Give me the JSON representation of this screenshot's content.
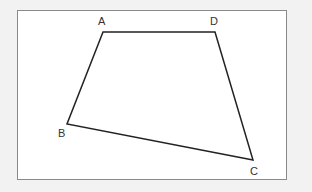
{
  "diagram": {
    "type": "quadrilateral",
    "vertices": [
      {
        "label": "A",
        "x": 103,
        "y": 32,
        "label_x": 98,
        "label_y": 25
      },
      {
        "label": "D",
        "x": 215,
        "y": 32,
        "label_x": 210,
        "label_y": 25
      },
      {
        "label": "C",
        "x": 253,
        "y": 160,
        "label_x": 250,
        "label_y": 175
      },
      {
        "label": "B",
        "x": 67,
        "y": 124,
        "label_x": 58,
        "label_y": 137
      }
    ],
    "edges": [
      "AD",
      "DC",
      "CB",
      "BA"
    ],
    "colors": {
      "frame": "#8a8a8a",
      "line": "#222222",
      "background": "#f2f2f2",
      "canvas": "#ffffff"
    }
  }
}
